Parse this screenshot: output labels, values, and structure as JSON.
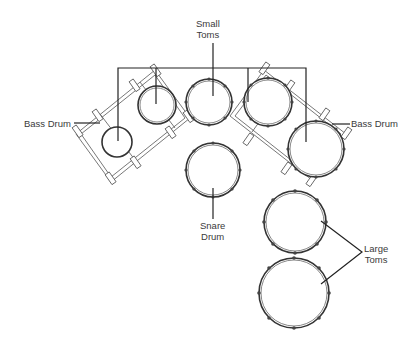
{
  "labels": {
    "small_toms": [
      "Small",
      "Toms"
    ],
    "bass_drum_left": "Bass Drum",
    "bass_drum_right": "Bass Drum",
    "snare_drum": [
      "Snare",
      "Drum"
    ],
    "large_toms": [
      "Large",
      "Toms"
    ]
  },
  "colors": {
    "background": "#ffffff",
    "line": "#222222",
    "drum_outline": "#333333",
    "label_text": "#3a3a3a"
  },
  "drums": [
    {
      "name": "left-bass-drum-head",
      "cx": 117,
      "cy": 142,
      "r": 15
    },
    {
      "name": "small-tom-1",
      "cx": 157,
      "cy": 105,
      "r": 19
    },
    {
      "name": "small-tom-2",
      "cx": 209,
      "cy": 102,
      "r": 23
    },
    {
      "name": "small-tom-3",
      "cx": 268,
      "cy": 102,
      "r": 24
    },
    {
      "name": "right-bass-drum-head",
      "cx": 316,
      "cy": 141,
      "r": 28
    },
    {
      "name": "snare-drum",
      "cx": 213,
      "cy": 170,
      "r": 27
    },
    {
      "name": "large-tom-1",
      "cx": 295,
      "cy": 222,
      "r": 31
    },
    {
      "name": "large-tom-2",
      "cx": 294,
      "cy": 292,
      "r": 35
    }
  ]
}
